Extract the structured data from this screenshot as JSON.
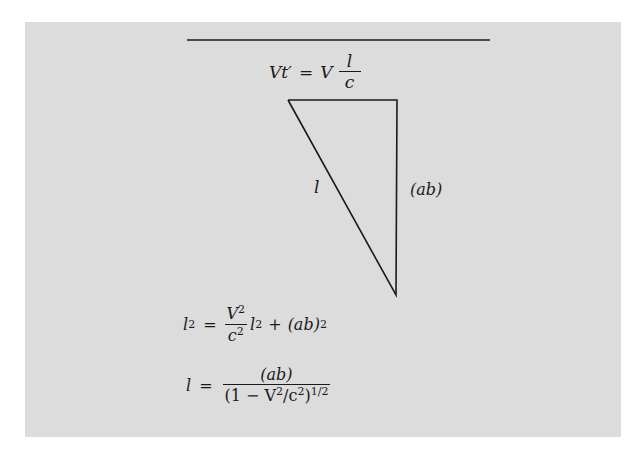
{
  "figure": {
    "top_equation": {
      "lhs": "Vt′",
      "equals": "=",
      "rhs_factor": "V",
      "frac_num": "l",
      "frac_den": "c"
    },
    "triangle": {
      "hypotenuse_label": "l",
      "vertical_side_label": "(ab)",
      "vertices": {
        "top_left": [
          288,
          100
        ],
        "top_right": [
          397,
          100
        ],
        "bottom": [
          396,
          295
        ]
      }
    },
    "equation1": {
      "lhs": "l",
      "lhs_exp": "2",
      "equals": "=",
      "frac_num": "V",
      "frac_num_exp": "2",
      "frac_den": "c",
      "frac_den_exp": "2",
      "term_var": "l",
      "term_exp": "2",
      "plus": "+",
      "last_term": "(ab)",
      "last_exp": "2"
    },
    "equation2": {
      "lhs": "l",
      "equals": "=",
      "frac_num": "(ab)",
      "den_open": "(1 − V",
      "den_v_exp": "2",
      "den_mid": "/c",
      "den_c_exp": "2",
      "den_close": ")",
      "den_outer_exp": "1/2"
    },
    "colors": {
      "panel": "#dcdcdc",
      "ink": "#1a1a1a",
      "background": "#ffffff"
    }
  }
}
